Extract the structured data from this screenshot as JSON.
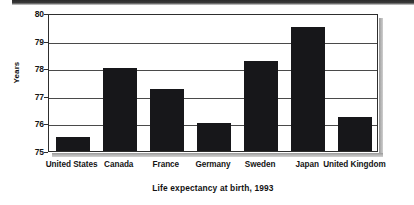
{
  "chart_data": {
    "type": "bar",
    "title": "",
    "subtitle": "",
    "xlabel": "Life expectancy at birth, 1993",
    "ylabel": "Years",
    "categories": [
      "United States",
      "Canada",
      "France",
      "Germany",
      "Sweden",
      "Japan",
      "United Kingdom"
    ],
    "values": [
      75.5,
      78.0,
      77.25,
      76.0,
      78.25,
      79.5,
      76.25
    ],
    "ylim": [
      75,
      80
    ],
    "y_ticks": [
      75,
      76,
      77,
      78,
      79,
      80
    ],
    "y_tick_labels": [
      "75",
      "76",
      "77",
      "78",
      "79",
      "80"
    ],
    "grid": "horizontal",
    "legend": "none",
    "bar_color": "#17171a",
    "frame_color": "#2e2e2e",
    "plot_background": "#ffffff"
  },
  "axes": {
    "y_title": "Years",
    "x_title": "Life expectancy at birth, 1993"
  }
}
